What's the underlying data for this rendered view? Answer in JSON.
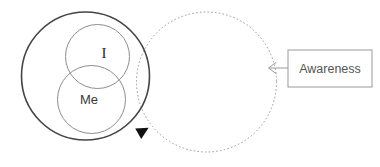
{
  "diagram": {
    "background_color": "#ffffff",
    "shapes": {
      "outer_self_circle": {
        "name": "Self (outer solid circle)",
        "cx": 85.5,
        "cy": 76,
        "r": 64,
        "stroke": "#444444",
        "stroke_width": 1.6,
        "style": "solid",
        "fill": "none"
      },
      "i_circle": {
        "name": "I",
        "label": "I",
        "cx": 97.5,
        "cy": 56.5,
        "r": 32,
        "stroke": "#8d8d8d",
        "stroke_width": 1,
        "style": "solid",
        "fill": "none",
        "label_x": 104,
        "label_y": 58
      },
      "me_circle": {
        "name": "Me",
        "label": "Me",
        "cx": 91.5,
        "cy": 99.5,
        "r": 34,
        "stroke": "#8d8d8d",
        "stroke_width": 1,
        "style": "solid",
        "fill": "none",
        "label_x": 89,
        "label_y": 104
      },
      "awareness_circle": {
        "name": "Awareness (dotted circle)",
        "cx": 206.5,
        "cy": 82,
        "r": 70,
        "stroke": "#9a9a9a",
        "stroke_width": 1,
        "style": "dotted",
        "dash_pattern": "0.8 3",
        "fill": "none"
      }
    },
    "arrowhead_marker": {
      "name": "filled triangle on awareness circle",
      "x": 143,
      "y": 131,
      "rotation_deg": -28,
      "fill": "#111111",
      "size": 11
    },
    "callout": {
      "box": {
        "label": "Awareness",
        "x": 288,
        "y": 50,
        "width": 84,
        "height": 37,
        "stroke": "#9a9a9a",
        "stroke_width": 1,
        "fill": "#ffffff",
        "text_x": 330,
        "text_y": 73
      },
      "connector": {
        "name": "arrow from Awareness box to dotted circle",
        "from_x": 288,
        "to_x": 268,
        "y": 68,
        "stroke": "#9a9a9a",
        "stroke_width": 1,
        "arrowhead": "open-left-chevron"
      }
    }
  }
}
